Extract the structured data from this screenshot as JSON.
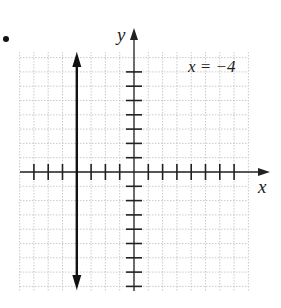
{
  "chart_data": {
    "type": "line",
    "title": "",
    "equation_label": "x = −4",
    "xlabel": "x",
    "ylabel": "y",
    "xlim": [
      -8,
      8
    ],
    "ylim": [
      -8,
      8
    ],
    "grid": true,
    "legend": "none",
    "x_ticks": [
      -7,
      -6,
      -5,
      -4,
      -3,
      -2,
      -1,
      1,
      2,
      3,
      4,
      5,
      6,
      7
    ],
    "y_ticks": [
      -8,
      -7,
      -6,
      -5,
      -4,
      -3,
      -2,
      -1,
      1,
      2,
      3,
      4,
      5,
      6,
      7
    ],
    "series": [
      {
        "name": "x = -4",
        "type": "vertical-line",
        "x": -4,
        "y_range": [
          -8,
          8
        ],
        "arrows": "both"
      }
    ]
  },
  "labels": {
    "x_axis": "x",
    "y_axis": "y",
    "equation": "x = −4"
  },
  "colors": {
    "axis": "#222222",
    "line": "#111111",
    "grid": "#bdbdbd"
  }
}
